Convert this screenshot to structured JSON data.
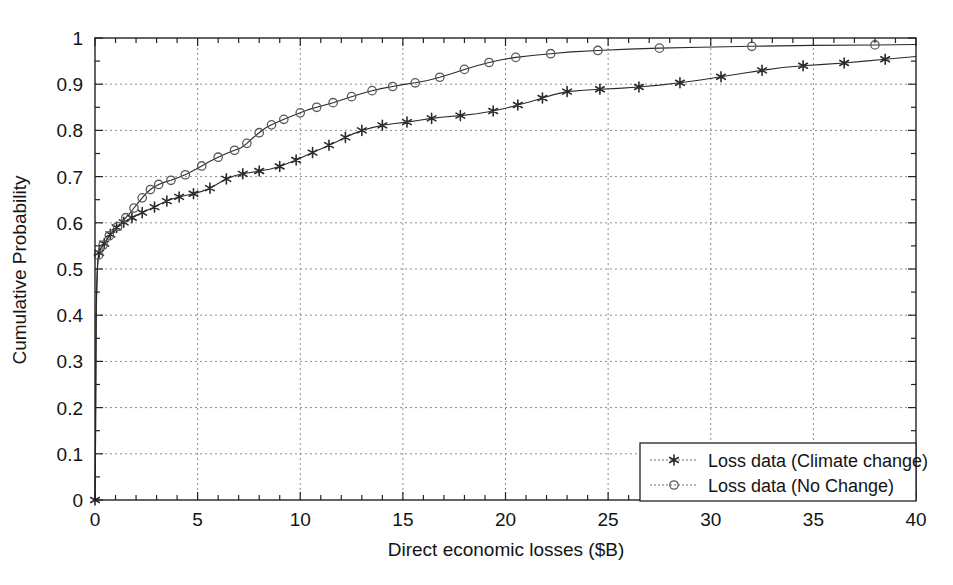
{
  "chart_data": {
    "type": "line",
    "title": "",
    "subtitle": "",
    "xlabel": "Direct economic losses ($B)",
    "ylabel": "Cumulative Probability",
    "xlim": [
      0,
      40
    ],
    "ylim": [
      0,
      1
    ],
    "grid": true,
    "legend_position": "lower right",
    "x_ticks": [
      0,
      5,
      10,
      15,
      20,
      25,
      30,
      35,
      40
    ],
    "x_tick_labels": [
      "0",
      "5",
      "10",
      "15",
      "20",
      "25",
      "30",
      "35",
      "40"
    ],
    "x_minor_tick_step": 1,
    "y_ticks": [
      0,
      0.1,
      0.2,
      0.3,
      0.4,
      0.5,
      0.6,
      0.7,
      0.8,
      0.9,
      1
    ],
    "y_tick_labels": [
      "0",
      "0.1",
      "0.2",
      "0.3",
      "0.4",
      "0.5",
      "0.6",
      "0.7",
      "0.8",
      "0.9",
      "1"
    ],
    "series": [
      {
        "name": "Loss data (Climate change)",
        "marker": "star",
        "color": "#2b2b2b",
        "points": [
          [
            0.0,
            0.0
          ],
          [
            0.02,
            0.08
          ],
          [
            0.03,
            0.16
          ],
          [
            0.04,
            0.24
          ],
          [
            0.05,
            0.32
          ],
          [
            0.06,
            0.4
          ],
          [
            0.08,
            0.44
          ],
          [
            0.1,
            0.47
          ],
          [
            0.12,
            0.5
          ],
          [
            0.15,
            0.52
          ],
          [
            0.2,
            0.535
          ],
          [
            0.3,
            0.545
          ],
          [
            0.45,
            0.555
          ],
          [
            0.6,
            0.565
          ],
          [
            0.75,
            0.575
          ],
          [
            0.9,
            0.583
          ],
          [
            1.05,
            0.59
          ],
          [
            1.2,
            0.596
          ],
          [
            1.4,
            0.601
          ],
          [
            1.6,
            0.606
          ],
          [
            1.8,
            0.611
          ],
          [
            2.0,
            0.616
          ],
          [
            2.3,
            0.622
          ],
          [
            2.6,
            0.628
          ],
          [
            2.9,
            0.634
          ],
          [
            3.2,
            0.641
          ],
          [
            3.5,
            0.647
          ],
          [
            3.8,
            0.652
          ],
          [
            4.1,
            0.656
          ],
          [
            4.4,
            0.659
          ],
          [
            4.8,
            0.663
          ],
          [
            5.2,
            0.668
          ],
          [
            5.6,
            0.675
          ],
          [
            6.0,
            0.685
          ],
          [
            6.4,
            0.695
          ],
          [
            6.8,
            0.702
          ],
          [
            7.2,
            0.706
          ],
          [
            7.6,
            0.709
          ],
          [
            8.0,
            0.712
          ],
          [
            8.5,
            0.716
          ],
          [
            9.0,
            0.722
          ],
          [
            9.4,
            0.729
          ],
          [
            9.8,
            0.736
          ],
          [
            10.2,
            0.744
          ],
          [
            10.6,
            0.752
          ],
          [
            11.0,
            0.76
          ],
          [
            11.4,
            0.768
          ],
          [
            11.8,
            0.776
          ],
          [
            12.2,
            0.785
          ],
          [
            12.6,
            0.793
          ],
          [
            13.0,
            0.8
          ],
          [
            13.5,
            0.806
          ],
          [
            14.0,
            0.811
          ],
          [
            14.6,
            0.815
          ],
          [
            15.2,
            0.818
          ],
          [
            15.8,
            0.822
          ],
          [
            16.4,
            0.826
          ],
          [
            17.0,
            0.829
          ],
          [
            17.8,
            0.832
          ],
          [
            18.6,
            0.836
          ],
          [
            19.4,
            0.842
          ],
          [
            20.0,
            0.848
          ],
          [
            20.6,
            0.855
          ],
          [
            21.2,
            0.862
          ],
          [
            21.8,
            0.87
          ],
          [
            22.4,
            0.878
          ],
          [
            23.0,
            0.884
          ],
          [
            23.8,
            0.887
          ],
          [
            24.6,
            0.889
          ],
          [
            25.5,
            0.891
          ],
          [
            26.5,
            0.894
          ],
          [
            27.5,
            0.898
          ],
          [
            28.5,
            0.903
          ],
          [
            29.5,
            0.909
          ],
          [
            30.5,
            0.916
          ],
          [
            31.5,
            0.923
          ],
          [
            32.5,
            0.93
          ],
          [
            33.5,
            0.936
          ],
          [
            34.5,
            0.94
          ],
          [
            35.5,
            0.943
          ],
          [
            36.5,
            0.946
          ],
          [
            37.5,
            0.95
          ],
          [
            38.5,
            0.954
          ],
          [
            40.0,
            0.96
          ]
        ],
        "marker_points": [
          [
            0.0,
            0.0
          ],
          [
            0.2,
            0.535
          ],
          [
            0.45,
            0.555
          ],
          [
            0.75,
            0.575
          ],
          [
            1.05,
            0.59
          ],
          [
            1.4,
            0.601
          ],
          [
            1.8,
            0.611
          ],
          [
            2.3,
            0.622
          ],
          [
            2.9,
            0.634
          ],
          [
            3.5,
            0.647
          ],
          [
            4.1,
            0.656
          ],
          [
            4.8,
            0.663
          ],
          [
            5.6,
            0.675
          ],
          [
            6.4,
            0.695
          ],
          [
            7.2,
            0.706
          ],
          [
            8.0,
            0.712
          ],
          [
            9.0,
            0.722
          ],
          [
            9.8,
            0.736
          ],
          [
            10.6,
            0.752
          ],
          [
            11.4,
            0.768
          ],
          [
            12.2,
            0.785
          ],
          [
            13.0,
            0.8
          ],
          [
            14.0,
            0.811
          ],
          [
            15.2,
            0.818
          ],
          [
            16.4,
            0.826
          ],
          [
            17.8,
            0.832
          ],
          [
            19.4,
            0.842
          ],
          [
            20.6,
            0.855
          ],
          [
            21.8,
            0.87
          ],
          [
            23.0,
            0.884
          ],
          [
            24.6,
            0.889
          ],
          [
            26.5,
            0.894
          ],
          [
            28.5,
            0.903
          ],
          [
            30.5,
            0.916
          ],
          [
            32.5,
            0.93
          ],
          [
            34.5,
            0.94
          ],
          [
            36.5,
            0.946
          ],
          [
            38.5,
            0.954
          ]
        ]
      },
      {
        "name": "Loss data (No Change)",
        "marker": "circle",
        "color": "#5a5a5a",
        "points": [
          [
            0.0,
            0.0
          ],
          [
            0.02,
            0.09
          ],
          [
            0.03,
            0.18
          ],
          [
            0.04,
            0.27
          ],
          [
            0.05,
            0.35
          ],
          [
            0.06,
            0.42
          ],
          [
            0.08,
            0.46
          ],
          [
            0.1,
            0.49
          ],
          [
            0.13,
            0.515
          ],
          [
            0.17,
            0.53
          ],
          [
            0.25,
            0.542
          ],
          [
            0.4,
            0.552
          ],
          [
            0.55,
            0.562
          ],
          [
            0.7,
            0.572
          ],
          [
            0.9,
            0.582
          ],
          [
            1.1,
            0.592
          ],
          [
            1.3,
            0.601
          ],
          [
            1.5,
            0.611
          ],
          [
            1.7,
            0.621
          ],
          [
            1.9,
            0.632
          ],
          [
            2.1,
            0.643
          ],
          [
            2.3,
            0.654
          ],
          [
            2.5,
            0.664
          ],
          [
            2.7,
            0.672
          ],
          [
            2.9,
            0.678
          ],
          [
            3.1,
            0.683
          ],
          [
            3.4,
            0.688
          ],
          [
            3.7,
            0.692
          ],
          [
            4.0,
            0.697
          ],
          [
            4.4,
            0.704
          ],
          [
            4.8,
            0.713
          ],
          [
            5.2,
            0.723
          ],
          [
            5.6,
            0.733
          ],
          [
            6.0,
            0.742
          ],
          [
            6.4,
            0.75
          ],
          [
            6.8,
            0.757
          ],
          [
            7.1,
            0.762
          ],
          [
            7.4,
            0.772
          ],
          [
            7.7,
            0.784
          ],
          [
            8.0,
            0.795
          ],
          [
            8.3,
            0.805
          ],
          [
            8.6,
            0.812
          ],
          [
            8.9,
            0.818
          ],
          [
            9.2,
            0.824
          ],
          [
            9.6,
            0.831
          ],
          [
            10.0,
            0.838
          ],
          [
            10.4,
            0.845
          ],
          [
            10.8,
            0.85
          ],
          [
            11.2,
            0.855
          ],
          [
            11.6,
            0.86
          ],
          [
            12.0,
            0.866
          ],
          [
            12.5,
            0.873
          ],
          [
            13.0,
            0.88
          ],
          [
            13.5,
            0.886
          ],
          [
            14.0,
            0.891
          ],
          [
            14.5,
            0.895
          ],
          [
            15.0,
            0.899
          ],
          [
            15.6,
            0.903
          ],
          [
            16.2,
            0.908
          ],
          [
            16.8,
            0.915
          ],
          [
            17.4,
            0.923
          ],
          [
            18.0,
            0.932
          ],
          [
            18.6,
            0.94
          ],
          [
            19.2,
            0.947
          ],
          [
            19.8,
            0.953
          ],
          [
            20.5,
            0.958
          ],
          [
            21.3,
            0.962
          ],
          [
            22.2,
            0.966
          ],
          [
            23.2,
            0.97
          ],
          [
            24.5,
            0.973
          ],
          [
            26.0,
            0.976
          ],
          [
            27.5,
            0.978
          ],
          [
            29.5,
            0.98
          ],
          [
            32.0,
            0.982
          ],
          [
            35.0,
            0.984
          ],
          [
            38.0,
            0.985
          ],
          [
            40.0,
            0.986
          ]
        ],
        "marker_points": [
          [
            0.17,
            0.53
          ],
          [
            0.4,
            0.552
          ],
          [
            0.7,
            0.572
          ],
          [
            1.1,
            0.592
          ],
          [
            1.5,
            0.611
          ],
          [
            1.9,
            0.632
          ],
          [
            2.3,
            0.654
          ],
          [
            2.7,
            0.672
          ],
          [
            3.1,
            0.683
          ],
          [
            3.7,
            0.692
          ],
          [
            4.4,
            0.704
          ],
          [
            5.2,
            0.723
          ],
          [
            6.0,
            0.742
          ],
          [
            6.8,
            0.757
          ],
          [
            7.4,
            0.772
          ],
          [
            8.0,
            0.795
          ],
          [
            8.6,
            0.812
          ],
          [
            9.2,
            0.824
          ],
          [
            10.0,
            0.838
          ],
          [
            10.8,
            0.85
          ],
          [
            11.6,
            0.86
          ],
          [
            12.5,
            0.873
          ],
          [
            13.5,
            0.886
          ],
          [
            14.5,
            0.895
          ],
          [
            15.6,
            0.903
          ],
          [
            16.8,
            0.915
          ],
          [
            18.0,
            0.932
          ],
          [
            19.2,
            0.947
          ],
          [
            20.5,
            0.958
          ],
          [
            22.2,
            0.966
          ],
          [
            24.5,
            0.973
          ],
          [
            27.5,
            0.978
          ],
          [
            32.0,
            0.982
          ],
          [
            38.0,
            0.985
          ]
        ]
      }
    ]
  },
  "legend": {
    "items": [
      {
        "label": "Loss data (Climate change)",
        "marker": "star"
      },
      {
        "label": "Loss data (No Change)",
        "marker": "circle"
      }
    ]
  }
}
